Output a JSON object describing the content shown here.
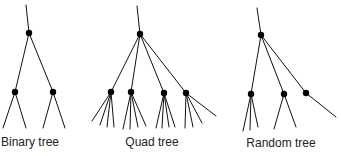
{
  "diagram": {
    "title": "",
    "colors": {
      "edge": "#111111",
      "node": "#000000",
      "label": "#222222"
    },
    "trees": [
      {
        "id": "binary",
        "label": "Binary tree",
        "label_pos": [
          30,
          146
        ],
        "stem": [
          [
            26,
            5
          ],
          [
            29,
            33
          ]
        ],
        "nodes": [
          [
            29,
            33
          ],
          [
            15,
            92
          ],
          [
            53,
            92
          ]
        ],
        "edges": [
          [
            [
              29,
              33
            ],
            [
              15,
              92
            ]
          ],
          [
            [
              29,
              33
            ],
            [
              53,
              92
            ]
          ],
          [
            [
              15,
              92
            ],
            [
              3,
              128
            ]
          ],
          [
            [
              15,
              92
            ],
            [
              26,
              128
            ]
          ],
          [
            [
              53,
              92
            ],
            [
              43,
              128
            ]
          ],
          [
            [
              53,
              92
            ],
            [
              65,
              128
            ]
          ]
        ]
      },
      {
        "id": "quad",
        "label": "Quad tree",
        "label_pos": [
          152,
          146
        ],
        "stem": [
          [
            137,
            6
          ],
          [
            140,
            34
          ]
        ],
        "nodes": [
          [
            140,
            34
          ],
          [
            111,
            92
          ],
          [
            131,
            92
          ],
          [
            164,
            93
          ],
          [
            186,
            93
          ]
        ],
        "edges": [
          [
            [
              140,
              34
            ],
            [
              111,
              92
            ]
          ],
          [
            [
              140,
              34
            ],
            [
              131,
              92
            ]
          ],
          [
            [
              140,
              34
            ],
            [
              164,
              93
            ]
          ],
          [
            [
              140,
              34
            ],
            [
              186,
              93
            ]
          ],
          [
            [
              111,
              92
            ],
            [
              92,
              121
            ]
          ],
          [
            [
              111,
              92
            ],
            [
              100,
              125
            ]
          ],
          [
            [
              111,
              92
            ],
            [
              107,
              127
            ]
          ],
          [
            [
              111,
              92
            ],
            [
              114,
              127
            ]
          ],
          [
            [
              131,
              92
            ],
            [
              123,
              129
            ]
          ],
          [
            [
              131,
              92
            ],
            [
              130,
              129
            ]
          ],
          [
            [
              131,
              92
            ],
            [
              138,
              127
            ]
          ],
          [
            [
              131,
              92
            ],
            [
              146,
              126
            ]
          ],
          [
            [
              164,
              93
            ],
            [
              156,
              128
            ]
          ],
          [
            [
              164,
              93
            ],
            [
              162,
              128
            ]
          ],
          [
            [
              164,
              93
            ],
            [
              169,
              127
            ]
          ],
          [
            [
              164,
              93
            ],
            [
              175,
              127
            ]
          ],
          [
            [
              186,
              93
            ],
            [
              185,
              128
            ]
          ],
          [
            [
              186,
              93
            ],
            [
              193,
              127
            ]
          ],
          [
            [
              186,
              93
            ],
            [
              202,
              123
            ]
          ],
          [
            [
              186,
              93
            ],
            [
              216,
              116
            ]
          ]
        ]
      },
      {
        "id": "random",
        "label": "Random tree",
        "label_pos": [
          281,
          147
        ],
        "stem": [
          [
            257,
            8
          ],
          [
            261,
            35
          ]
        ],
        "nodes": [
          [
            261,
            35
          ],
          [
            251,
            94
          ],
          [
            284,
            94
          ],
          [
            306,
            93
          ]
        ],
        "edges": [
          [
            [
              261,
              35
            ],
            [
              251,
              94
            ]
          ],
          [
            [
              261,
              35
            ],
            [
              284,
              94
            ]
          ],
          [
            [
              261,
              35
            ],
            [
              306,
              93
            ]
          ],
          [
            [
              306,
              93
            ],
            [
              336,
              117
            ]
          ],
          [
            [
              251,
              94
            ],
            [
              243,
              131
            ]
          ],
          [
            [
              251,
              94
            ],
            [
              250,
              130
            ]
          ],
          [
            [
              251,
              94
            ],
            [
              258,
              127
            ]
          ],
          [
            [
              284,
              94
            ],
            [
              274,
              129
            ]
          ],
          [
            [
              284,
              94
            ],
            [
              296,
              127
            ]
          ]
        ]
      }
    ]
  }
}
